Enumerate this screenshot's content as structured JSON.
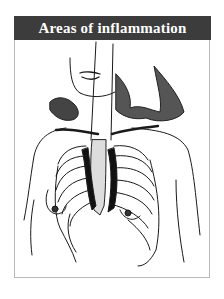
{
  "figure": {
    "title": "Areas of inflammation",
    "illustration": "line drawing of a woman's torso with rib cage and sternum visible, dark shading at costochondral junctions indicating inflammation",
    "colors": {
      "header_bg": "#3c3c3c",
      "header_text": "#ffffff",
      "line": "#1a1a1a",
      "border": "#b8b8b8"
    }
  }
}
